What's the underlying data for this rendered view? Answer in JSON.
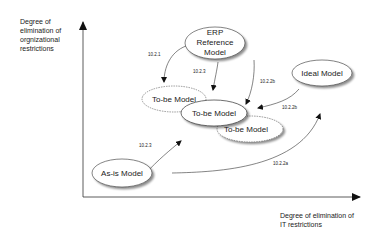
{
  "diagram": {
    "y_axis_label": [
      "Degree of",
      "elimination of",
      "orgnizational",
      "restrictions"
    ],
    "x_axis_label": [
      "Degree of elimination of",
      "IT restrictions"
    ],
    "nodes": {
      "erp": {
        "lines": [
          "ERP",
          "Reference",
          "Model"
        ]
      },
      "ideal": {
        "label": "Ideal Model"
      },
      "tobe_back_left": {
        "label": "To-be Model"
      },
      "tobe_front": {
        "label": "To-be Model"
      },
      "tobe_back_right": {
        "label": "To-be Model"
      },
      "asis": {
        "label": "As-is Model"
      }
    },
    "edges": {
      "e1": {
        "label": "10.2.1"
      },
      "e2": {
        "label": "10.2.3"
      },
      "e3": {
        "label": "10.2.2b"
      },
      "e4": {
        "label": "10.2.2b"
      },
      "e5": {
        "label": "10.2.3"
      },
      "e6": {
        "label": "10.2.2a"
      }
    }
  }
}
